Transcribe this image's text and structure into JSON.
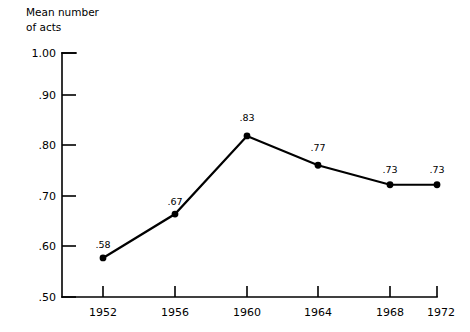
{
  "chart_data": {
    "type": "line",
    "title": "",
    "ylabel": "Mean number of acts",
    "ylabel_lines": [
      "Mean number",
      "of acts"
    ],
    "xlabel": "",
    "categories": [
      "1952",
      "1956",
      "1960",
      "1964",
      "1968",
      "1972"
    ],
    "x": [
      1952,
      1956,
      1960,
      1964,
      1968,
      1972
    ],
    "values": [
      0.58,
      0.67,
      0.83,
      0.77,
      0.73,
      0.73
    ],
    "point_labels": [
      ".58",
      ".67",
      ".83",
      ".77",
      ".73",
      ".73"
    ],
    "ylim": [
      0.5,
      1.0
    ],
    "yticks": [
      1.0,
      0.9,
      0.8,
      0.7,
      0.6,
      0.5
    ],
    "ytick_labels": [
      "1.00",
      ".90",
      ".80",
      ".70",
      ".60",
      ".50"
    ],
    "xtick_labels": [
      "1952",
      "1956",
      "1960",
      "1964",
      "1968",
      "1972"
    ],
    "grid": false,
    "legend": false,
    "legend_position": "none",
    "marker": "filled-circle",
    "line_color": "#000000",
    "marker_color": "#000000",
    "background_color": "#ffffff"
  }
}
